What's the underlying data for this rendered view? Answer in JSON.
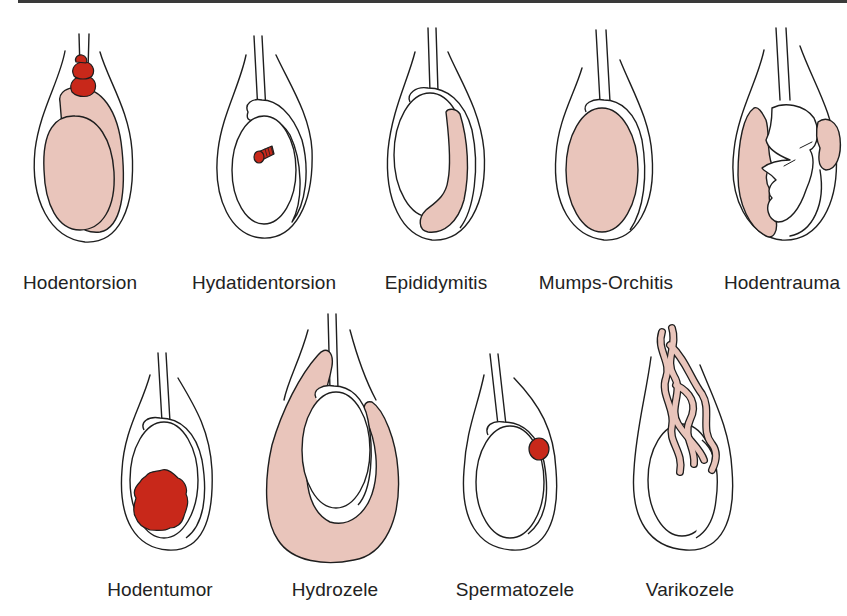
{
  "colors": {
    "outline": "#1e1e1e",
    "inflamed_tissue": "#e9c5bb",
    "critical_red": "#c8281a",
    "background": "#ffffff",
    "label_text": "#222222"
  },
  "row1": {
    "items": [
      {
        "label": "Hodentorsion"
      },
      {
        "label": "Hydatidentorsion"
      },
      {
        "label": "Epididymitis"
      },
      {
        "label": "Mumps-Orchitis"
      },
      {
        "label": "Hodentrauma"
      }
    ]
  },
  "row2": {
    "items": [
      {
        "label": "Hodentumor"
      },
      {
        "label": "Hydrozele"
      },
      {
        "label": "Spermatozele"
      },
      {
        "label": "Varikozele"
      }
    ]
  }
}
